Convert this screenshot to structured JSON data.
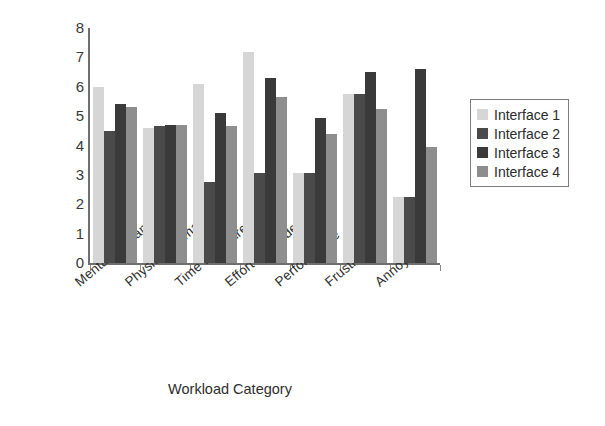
{
  "chart_data": {
    "type": "bar",
    "title": "",
    "xlabel": "Workload Category",
    "ylabel": "",
    "ylim": [
      0,
      8
    ],
    "yticks": [
      "0",
      "1",
      "2",
      "3",
      "4",
      "5",
      "6",
      "7",
      "8"
    ],
    "grid": false,
    "legend_position": "right",
    "categories": [
      "Mental Demand",
      "Physical Demand",
      "Time Pressure",
      "Effort expended",
      "Performance",
      "Frustration",
      "Annoyance"
    ],
    "series": [
      {
        "name": "Interface 1",
        "color": "#d6d6d6",
        "values": [
          6.0,
          4.6,
          6.1,
          7.2,
          3.05,
          5.75,
          2.25
        ]
      },
      {
        "name": "Interface 2",
        "color": "#4a4a4a",
        "values": [
          4.5,
          4.65,
          2.75,
          3.05,
          3.05,
          5.75,
          2.25
        ]
      },
      {
        "name": "Interface 3",
        "color": "#3a3a3a",
        "values": [
          5.4,
          4.7,
          5.1,
          6.3,
          4.95,
          6.5,
          6.6
        ]
      },
      {
        "name": "Interface 4",
        "color": "#8e8e8e",
        "values": [
          5.3,
          4.7,
          4.65,
          5.65,
          4.4,
          5.25,
          3.95
        ]
      }
    ]
  },
  "legend": {
    "entries": [
      {
        "label": "Interface 1",
        "swatch": "#d6d6d6"
      },
      {
        "label": "Interface 2",
        "swatch": "#4a4a4a"
      },
      {
        "label": "Interface 3",
        "swatch": "#3a3a3a"
      },
      {
        "label": "Interface 4",
        "swatch": "#8e8e8e"
      }
    ]
  },
  "axes": {
    "x_title": "Workload Category"
  }
}
